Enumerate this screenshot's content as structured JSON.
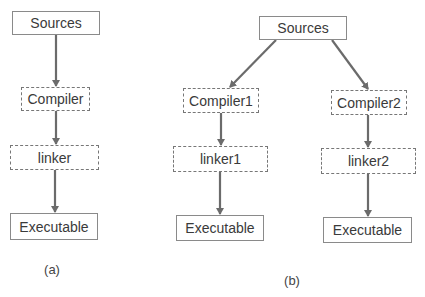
{
  "diagram_a": {
    "caption": "(a)",
    "nodes": {
      "sources": "Sources",
      "compiler": "Compiler",
      "linker": "linker",
      "executable": "Executable"
    }
  },
  "diagram_b": {
    "caption": "(b)",
    "nodes": {
      "sources": "Sources",
      "compiler1": "Compiler1",
      "compiler2": "Compiler2",
      "linker1": "linker1",
      "linker2": "linker2",
      "executable1": "Executable",
      "executable2": "Executable"
    }
  },
  "colors": {
    "arrow": "#6b6b6b",
    "solid_border": "#8a8a8a",
    "dashed_border": "#777777"
  }
}
